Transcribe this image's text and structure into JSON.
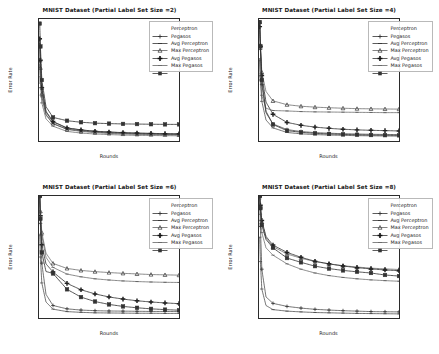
{
  "figure": {
    "background": "#ffffff",
    "layout": "2x2 grid of line charts",
    "series_color": "#333333"
  },
  "axis": {
    "xlabel": "Rounds",
    "ylabel": "Error Rate",
    "xticks": [
      "0",
      "20000",
      "40000",
      "60000",
      "80000",
      "100000"
    ],
    "yticks": [
      "0.1",
      "0.2",
      "0.3",
      "0.4",
      "0.5",
      "0.6",
      "0.7",
      "0.8",
      "0.9"
    ],
    "xlim": [
      0,
      100000
    ],
    "ylim": [
      0.1,
      0.9
    ]
  },
  "legend": {
    "entries": [
      {
        "label": "Perceptron",
        "marker": "plus-icon",
        "linestyle": "solid"
      },
      {
        "label": "Pegasos",
        "marker": "line-icon",
        "linestyle": "solid"
      },
      {
        "label": "Avg Perceptron",
        "marker": "triangle-icon",
        "linestyle": "solid"
      },
      {
        "label": "Max Perceptron",
        "marker": "bold-plus-icon",
        "linestyle": "solid"
      },
      {
        "label": "Avg Pegasos",
        "marker": "thin-line-icon",
        "linestyle": "solid"
      },
      {
        "label": "Max Pegasos",
        "marker": "square-icon",
        "linestyle": "solid"
      }
    ]
  },
  "panels": [
    {
      "id": "panel-size-2",
      "title": "MNIST Dataset (Partial Label Set Size =2)",
      "label_set_size": 2
    },
    {
      "id": "panel-size-4",
      "title": "MNIST Dataset (Partial Label Set Size =4)",
      "label_set_size": 4
    },
    {
      "id": "panel-size-6",
      "title": "MNIST Dataset (Partial Label Set Size =6)",
      "label_set_size": 6
    },
    {
      "id": "panel-size-8",
      "title": "MNIST Dataset (Partial Label Set Size =8)",
      "label_set_size": 8
    }
  ],
  "chart_data": [
    {
      "type": "line",
      "title": "MNIST Dataset (Partial Label Set Size =2)",
      "xlabel": "Rounds",
      "ylabel": "Error Rate",
      "xlim": [
        0,
        100000
      ],
      "ylim": [
        0.1,
        0.9
      ],
      "grid": false,
      "legend_position": "upper right",
      "x": [
        500,
        1000,
        2000,
        5000,
        10000,
        20000,
        30000,
        40000,
        50000,
        60000,
        70000,
        80000,
        90000,
        100000
      ],
      "series": [
        {
          "name": "Perceptron",
          "values": [
            0.77,
            0.62,
            0.44,
            0.29,
            0.225,
            0.185,
            0.172,
            0.163,
            0.158,
            0.154,
            0.151,
            0.149,
            0.147,
            0.146
          ]
        },
        {
          "name": "Pegasos",
          "values": [
            0.64,
            0.52,
            0.39,
            0.27,
            0.213,
            0.178,
            0.166,
            0.158,
            0.153,
            0.15,
            0.147,
            0.145,
            0.144,
            0.143
          ]
        },
        {
          "name": "Avg Perceptron",
          "values": [
            0.73,
            0.58,
            0.41,
            0.275,
            0.215,
            0.176,
            0.163,
            0.155,
            0.15,
            0.146,
            0.144,
            0.142,
            0.141,
            0.14
          ]
        },
        {
          "name": "Max Perceptron",
          "values": [
            0.77,
            0.63,
            0.45,
            0.295,
            0.228,
            0.186,
            0.173,
            0.164,
            0.159,
            0.155,
            0.152,
            0.15,
            0.148,
            0.147
          ]
        },
        {
          "name": "Avg Pegasos",
          "values": [
            0.6,
            0.48,
            0.35,
            0.245,
            0.197,
            0.163,
            0.152,
            0.146,
            0.142,
            0.139,
            0.137,
            0.136,
            0.135,
            0.134
          ]
        },
        {
          "name": "Max Pegasos",
          "values": [
            0.87,
            0.72,
            0.5,
            0.325,
            0.255,
            0.233,
            0.223,
            0.217,
            0.214,
            0.212,
            0.211,
            0.21,
            0.209,
            0.209
          ]
        }
      ]
    },
    {
      "type": "line",
      "title": "MNIST Dataset (Partial Label Set Size =4)",
      "xlabel": "Rounds",
      "ylabel": "Error Rate",
      "xlim": [
        0,
        100000
      ],
      "ylim": [
        0.1,
        0.9
      ],
      "grid": false,
      "legend_position": "upper right",
      "x": [
        500,
        1000,
        2000,
        5000,
        10000,
        20000,
        30000,
        40000,
        50000,
        60000,
        70000,
        80000,
        90000,
        100000
      ],
      "series": [
        {
          "name": "Perceptron",
          "values": [
            0.88,
            0.7,
            0.47,
            0.285,
            0.212,
            0.175,
            0.162,
            0.155,
            0.151,
            0.148,
            0.146,
            0.144,
            0.143,
            0.142
          ]
        },
        {
          "name": "Pegasos",
          "values": [
            0.63,
            0.5,
            0.36,
            0.238,
            0.186,
            0.156,
            0.147,
            0.142,
            0.139,
            0.137,
            0.135,
            0.134,
            0.133,
            0.132
          ]
        },
        {
          "name": "Avg Perceptron",
          "values": [
            0.88,
            0.73,
            0.55,
            0.425,
            0.363,
            0.338,
            0.328,
            0.322,
            0.318,
            0.315,
            0.312,
            0.311,
            0.31,
            0.309
          ]
        },
        {
          "name": "Max Perceptron",
          "values": [
            0.85,
            0.72,
            0.53,
            0.355,
            0.275,
            0.222,
            0.203,
            0.191,
            0.183,
            0.177,
            0.173,
            0.17,
            0.168,
            0.166
          ]
        },
        {
          "name": "Avg Pegasos",
          "values": [
            0.64,
            0.52,
            0.4,
            0.315,
            0.3,
            0.297,
            0.293,
            0.291,
            0.29,
            0.289,
            0.288,
            0.287,
            0.286,
            0.286
          ]
        },
        {
          "name": "Max Pegasos",
          "values": [
            0.88,
            0.72,
            0.5,
            0.295,
            0.208,
            0.168,
            0.157,
            0.15,
            0.146,
            0.143,
            0.141,
            0.139,
            0.138,
            0.137
          ]
        }
      ]
    },
    {
      "type": "line",
      "title": "MNIST Dataset (Partial Label Set Size =6)",
      "xlabel": "Rounds",
      "ylabel": "Error Rate",
      "xlim": [
        0,
        100000
      ],
      "ylim": [
        0.1,
        0.9
      ],
      "grid": false,
      "legend_position": "upper right",
      "x": [
        500,
        1000,
        2000,
        5000,
        10000,
        20000,
        30000,
        40000,
        50000,
        60000,
        70000,
        80000,
        90000,
        100000
      ],
      "series": [
        {
          "name": "Perceptron",
          "values": [
            0.9,
            0.72,
            0.46,
            0.255,
            0.182,
            0.16,
            0.152,
            0.148,
            0.146,
            0.145,
            0.144,
            0.143,
            0.143,
            0.142
          ]
        },
        {
          "name": "Pegasos",
          "values": [
            0.645,
            0.5,
            0.33,
            0.205,
            0.158,
            0.142,
            0.137,
            0.134,
            0.133,
            0.132,
            0.131,
            0.131,
            0.13,
            0.13
          ]
        },
        {
          "name": "Avg Perceptron",
          "values": [
            0.9,
            0.8,
            0.66,
            0.525,
            0.458,
            0.425,
            0.412,
            0.404,
            0.398,
            0.393,
            0.389,
            0.385,
            0.383,
            0.381
          ]
        },
        {
          "name": "Max Perceptron",
          "values": [
            0.9,
            0.77,
            0.58,
            0.455,
            0.402,
            0.327,
            0.285,
            0.258,
            0.238,
            0.224,
            0.213,
            0.205,
            0.199,
            0.194
          ]
        },
        {
          "name": "Avg Pegasos",
          "values": [
            0.9,
            0.79,
            0.64,
            0.498,
            0.432,
            0.388,
            0.37,
            0.357,
            0.349,
            0.343,
            0.339,
            0.336,
            0.334,
            0.333
          ]
        },
        {
          "name": "Max Pegasos",
          "values": [
            0.9,
            0.75,
            0.53,
            0.405,
            0.392,
            0.288,
            0.237,
            0.208,
            0.189,
            0.176,
            0.167,
            0.16,
            0.155,
            0.151
          ]
        }
      ]
    },
    {
      "type": "line",
      "title": "MNIST Dataset (Partial Label Set Size =8)",
      "xlabel": "Rounds",
      "ylabel": "Error Rate",
      "xlim": [
        0,
        100000
      ],
      "ylim": [
        0.1,
        0.9
      ],
      "grid": false,
      "legend_position": "upper right",
      "x": [
        500,
        1000,
        2000,
        5000,
        10000,
        20000,
        30000,
        40000,
        50000,
        60000,
        70000,
        80000,
        90000,
        100000
      ],
      "series": [
        {
          "name": "Perceptron",
          "values": [
            0.9,
            0.7,
            0.42,
            0.238,
            0.196,
            0.176,
            0.165,
            0.157,
            0.152,
            0.148,
            0.145,
            0.142,
            0.141,
            0.14
          ]
        },
        {
          "name": "Pegasos",
          "values": [
            0.63,
            0.47,
            0.29,
            0.182,
            0.155,
            0.145,
            0.14,
            0.136,
            0.134,
            0.132,
            0.13,
            0.129,
            0.128,
            0.127
          ]
        },
        {
          "name": "Avg Perceptron",
          "values": [
            0.9,
            0.83,
            0.73,
            0.625,
            0.568,
            0.52,
            0.492,
            0.47,
            0.455,
            0.443,
            0.434,
            0.427,
            0.422,
            0.418
          ]
        },
        {
          "name": "Max Perceptron",
          "values": [
            0.9,
            0.84,
            0.74,
            0.635,
            0.578,
            0.53,
            0.498,
            0.472,
            0.455,
            0.441,
            0.43,
            0.422,
            0.415,
            0.41
          ]
        },
        {
          "name": "Avg Pegasos",
          "values": [
            0.88,
            0.78,
            0.66,
            0.56,
            0.512,
            0.455,
            0.42,
            0.395,
            0.378,
            0.366,
            0.357,
            0.35,
            0.345,
            0.341
          ]
        },
        {
          "name": "Max Pegasos",
          "values": [
            0.9,
            0.82,
            0.71,
            0.615,
            0.56,
            0.493,
            0.465,
            0.44,
            0.424,
            0.412,
            0.403,
            0.395,
            0.382,
            0.375
          ]
        }
      ]
    }
  ]
}
